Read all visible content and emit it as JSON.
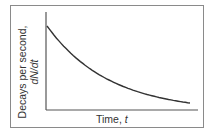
{
  "chart_data": {
    "type": "line",
    "title": "",
    "xlabel": "Time, t",
    "ylabel": "Decays per second, dN/dt",
    "ylabel_line1": "Decays per second,",
    "ylabel_line2": "dN/dt",
    "xlabel_text": "Time, ",
    "xlabel_var": "t",
    "grid": false,
    "legend": null,
    "x": [
      0,
      1,
      2,
      3,
      4,
      5,
      6
    ],
    "series": [
      {
        "name": "dN/dt",
        "values": [
          1.0,
          0.72,
          0.52,
          0.37,
          0.25,
          0.16,
          0.1
        ]
      }
    ],
    "line_color": "#333333"
  }
}
